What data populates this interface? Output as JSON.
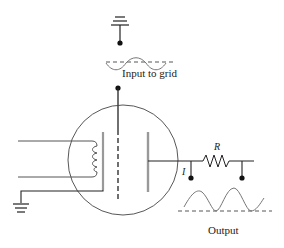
{
  "diagram": {
    "labels": {
      "input": "Input to grid",
      "output": "Output",
      "resistor": "R",
      "current": "I"
    },
    "colors": {
      "wire": "#222222",
      "electrode": "#999999",
      "wave": "#777777",
      "tube_outline": "#444444"
    }
  }
}
